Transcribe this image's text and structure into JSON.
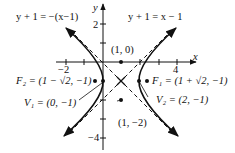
{
  "diagram": {
    "type": "hyperbola",
    "asymptotes": [
      {
        "label": "y + 1 = −(x−1)"
      },
      {
        "label": "y + 1 = x − 1"
      }
    ],
    "axes": {
      "x_label": "x",
      "y_label": "y",
      "ticks": {
        "x_neg": "−2",
        "x_pos": "4",
        "y_pos": "2",
        "y_neg": "−4"
      }
    },
    "points": {
      "top": "(1, 0)",
      "bottom": "(1, −2)",
      "F2": "F₂ = (1 − √2, −1)",
      "F1": "F₁ = (1 + √2, −1)",
      "V1": "V₁ = (0, −1)",
      "V2": "V₂ = (2, −1)"
    }
  }
}
